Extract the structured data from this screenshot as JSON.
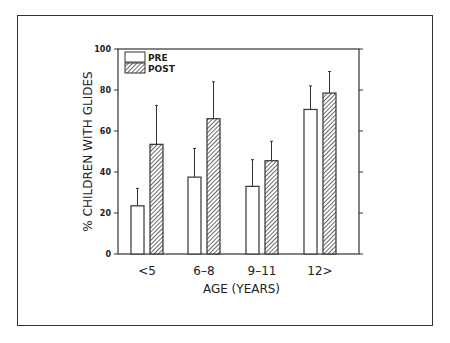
{
  "chart_data": {
    "type": "bar",
    "title": "",
    "xlabel": "AGE (YEARS)",
    "ylabel": "% CHILDREN WITH GLIDES",
    "ylim": [
      0,
      100
    ],
    "yticks": [
      0,
      20,
      40,
      60,
      80,
      100
    ],
    "categories": [
      "<5",
      "6-8",
      "9-11",
      "12>"
    ],
    "series": [
      {
        "name": "PRE",
        "fill": "white",
        "values": [
          23.5,
          37.5,
          33,
          70.5
        ],
        "error_upper": [
          32,
          51.5,
          46,
          82
        ]
      },
      {
        "name": "POST",
        "fill": "hatched",
        "values": [
          53.5,
          66,
          45.5,
          78.5
        ],
        "error_upper": [
          72.5,
          84,
          55,
          89
        ]
      }
    ],
    "legend": {
      "position": "upper-left",
      "entries": [
        "PRE",
        "POST"
      ]
    },
    "grid": false
  },
  "colors": {
    "line": "#333333",
    "hatch": "#444444",
    "background": "#ffffff"
  }
}
